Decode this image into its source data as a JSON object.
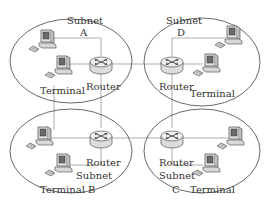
{
  "diagram": {
    "type": "network-topology",
    "colors": {
      "background": "#ffffff",
      "subnet_outline": "#444444",
      "link": "#9a9a9a",
      "text": "#333333",
      "device": "#cfcfcf"
    },
    "subnets": [
      {
        "id": "A",
        "label_line1": "Subnet",
        "label_line2": "A",
        "router_label": "Router",
        "terminal_label": "Terminal"
      },
      {
        "id": "D",
        "label_line1": "Subnet",
        "label_line2": "D",
        "router_label": "Router",
        "terminal_label": "Terminal"
      },
      {
        "id": "B",
        "label_line1": "Subnet",
        "label_line2": "B",
        "router_label": "Router",
        "terminal_label": "Terminal"
      },
      {
        "id": "C",
        "label_line1": "Subnet",
        "label_line2": "C",
        "router_label": "Router",
        "terminal_label": "Terminal"
      }
    ],
    "nodes_per_subnet": {
      "routers": 1,
      "terminals": 2
    },
    "inter_subnet_links": [
      [
        "A",
        "D"
      ],
      [
        "A",
        "B"
      ],
      [
        "D",
        "C"
      ],
      [
        "B",
        "C"
      ]
    ],
    "icons": {
      "router": "router-icon",
      "terminal": "computer-terminal-icon"
    }
  }
}
